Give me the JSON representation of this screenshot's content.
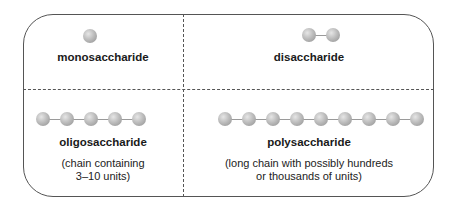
{
  "quadrants": {
    "mono": {
      "label": "monosaccharide",
      "units": 1
    },
    "di": {
      "label": "disaccharide",
      "units": 2
    },
    "oligo": {
      "label": "oligosaccharide",
      "units": 5,
      "desc_line1": "(chain containing",
      "desc_line2": "3–10 units)"
    },
    "poly": {
      "label": "polysaccharide",
      "units": 9,
      "desc_line1": "(long chain with possibly hundreds",
      "desc_line2": "or thousands of units)"
    }
  },
  "colors": {
    "border": "#555555",
    "sphere": "#b5b5b5",
    "bond": "#9a9a9a"
  }
}
